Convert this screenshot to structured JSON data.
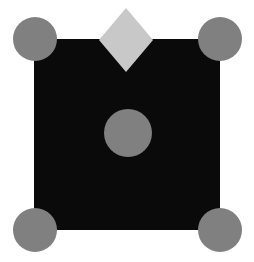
{
  "figure": {
    "canvas": {
      "width": 254,
      "height": 262,
      "background_color": "#ffffff"
    },
    "top_text_fragment": "......",
    "shapes": [
      {
        "name": "black-square",
        "type": "square",
        "fill_color": "#0a0a0a",
        "x": 34,
        "y": 39,
        "width": 186,
        "height": 191
      },
      {
        "name": "corner-circle-top-left",
        "type": "circle",
        "fill_color": "#808080",
        "cx": 35,
        "cy": 39,
        "r": 22
      },
      {
        "name": "corner-circle-top-right",
        "type": "circle",
        "fill_color": "#808080",
        "cx": 220,
        "cy": 39,
        "r": 22
      },
      {
        "name": "corner-circle-bottom-left",
        "type": "circle",
        "fill_color": "#808080",
        "cx": 35,
        "cy": 230,
        "r": 22
      },
      {
        "name": "corner-circle-bottom-right",
        "type": "circle",
        "fill_color": "#808080",
        "cx": 220,
        "cy": 230,
        "r": 22
      },
      {
        "name": "center-circle",
        "type": "circle",
        "fill_color": "#808080",
        "cx": 128,
        "cy": 133,
        "r": 24
      },
      {
        "name": "top-diamond",
        "type": "diamond",
        "fill_color": "#c8c8c8",
        "cx": 126,
        "cy": 40,
        "half_width": 27,
        "half_height": 32
      }
    ],
    "colors": {
      "square_fill": "#0a0a0a",
      "circle_fill": "#808080",
      "diamond_fill": "#c8c8c8",
      "background": "#ffffff"
    }
  }
}
